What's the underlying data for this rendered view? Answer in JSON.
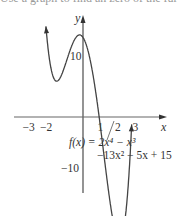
{
  "header": {
    "cut_text": "Use a graph to find an zero of the function"
  },
  "chart_data": {
    "type": "line",
    "title": "",
    "function_label_line1": "f(x) = 2x⁴ − x³",
    "function_label_line2": "−13x² − 5x + 15",
    "xlabel": "x",
    "ylabel": "y",
    "x_ticks": [
      "−3",
      "−2",
      "1",
      "2",
      "3"
    ],
    "x_tick_values": [
      -3,
      -2,
      1,
      2,
      3
    ],
    "y_ticks": [
      "10",
      "−10"
    ],
    "y_tick_values": [
      10,
      -10
    ],
    "xlim": [
      -3.6,
      4.5
    ],
    "ylim": [
      -21,
      22
    ],
    "coefficients": [
      2,
      -1,
      -13,
      -5,
      15
    ],
    "series": [
      {
        "name": "f(x)",
        "x": [
          -2.55,
          -2.4,
          -2.2,
          -2.0,
          -1.8,
          -1.6,
          -1.4,
          -1.2,
          -1.0,
          -0.8,
          -0.6,
          -0.4,
          -0.2,
          0.0,
          0.2,
          0.4,
          0.6,
          0.8,
          1.0,
          1.2,
          1.4,
          1.6,
          1.8,
          2.0,
          2.2,
          2.4,
          2.6,
          2.75
        ],
        "values": [
          20.4,
          11.1,
          2.1,
          -3.0,
          -6.1,
          -6.4,
          -4.6,
          -1.5,
          2.0,
          5.6,
          9.1,
          12.3,
          14.6,
          15.0,
          13.5,
          10.1,
          5.8,
          1.0,
          -2.0,
          -4.3,
          -5.9,
          -5.7,
          -3.6,
          1.0,
          7.6,
          16.5,
          28.0,
          37.7
        ]
      }
    ],
    "grid": false,
    "legend": "none"
  },
  "colors": {
    "curve": "#444444",
    "axis": "#555555",
    "text": "#333333"
  }
}
